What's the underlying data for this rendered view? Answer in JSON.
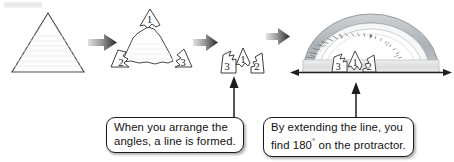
{
  "figure": {
    "background": "#ffffff",
    "ink": "#2b2b2b"
  },
  "steps": [
    {
      "id": "step-1",
      "name": "whole-triangle",
      "caption": ""
    },
    {
      "id": "step-2",
      "name": "triangle-with-torn-corners",
      "caption": ""
    },
    {
      "id": "step-3",
      "name": "arranged-corners",
      "caption": ""
    },
    {
      "id": "step-4",
      "name": "corners-on-protractor",
      "caption": ""
    }
  ],
  "angle_labels": {
    "triangle": [
      "1",
      "2",
      "3"
    ],
    "arranged": [
      "3",
      "1",
      "2"
    ],
    "protractor": [
      "3",
      "1",
      "2"
    ]
  },
  "arrows": [
    {
      "name": "arrow-1",
      "direction": "right"
    },
    {
      "name": "arrow-2",
      "direction": "right"
    },
    {
      "name": "arrow-3",
      "direction": "right"
    }
  ],
  "callouts": [
    {
      "name": "callout-arrange",
      "line1": "When you arrange the",
      "line2": "angles, a line is formed."
    },
    {
      "name": "callout-extend",
      "line1": "By extending the line, you",
      "line2_pre": "find 180",
      "line2_deg": "°",
      "line2_post": " on the protractor."
    }
  ],
  "protractor": {
    "name": "protractor",
    "measure_label": "180",
    "tick_count": 36,
    "band_color": "#b9bec2",
    "face_color": "#ffffff"
  },
  "baseline": {
    "name": "extended-line",
    "style": "double-headed-arrow"
  },
  "colors": {
    "outline": "#3a3a3a",
    "arrow_dark": "#2e2e2e",
    "arrow_light": "#d8d8d8",
    "paper_rule": "#e6e6e6",
    "callout_border": "#1a1a1a"
  }
}
